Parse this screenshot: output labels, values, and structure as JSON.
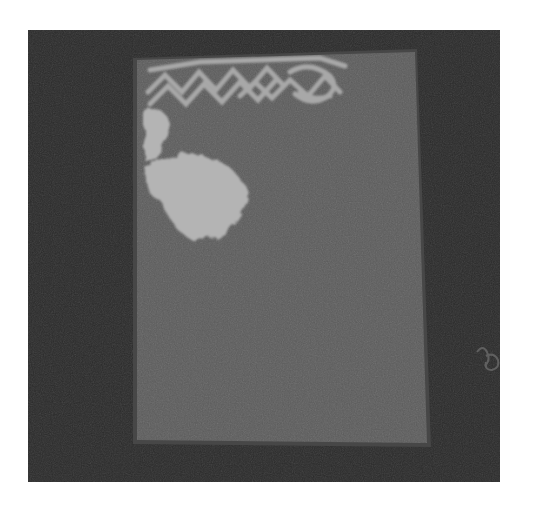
{
  "image": {
    "description": "Grayscale photograph of a rectangular gray card on a dark background, with a light zigzag pattern along the top edge, two pale cloud-like blobs on the upper left, and a small faint marking on the right background",
    "background_color": "#2a2a2a",
    "page_color": "#ffffff",
    "card_color": "#5c5c5c",
    "card_edge_color": "#4a4a4a",
    "pattern_color": "#a8a8a8",
    "blob_color": "#b4b4b4"
  }
}
